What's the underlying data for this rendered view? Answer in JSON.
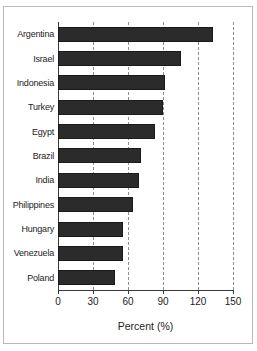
{
  "chart_data": {
    "type": "bar",
    "orientation": "horizontal",
    "title": "",
    "xlabel": "Percent (%)",
    "ylabel": "",
    "xlim": [
      0,
      150
    ],
    "xticks": [
      0,
      30,
      60,
      90,
      120,
      150
    ],
    "xtick_labels": [
      "0",
      "30",
      "60",
      "90",
      "120",
      "150"
    ],
    "grid": "vertical-dashed",
    "legend": "none",
    "bar_color": "#2b2b2b",
    "background_color": "#ffffff",
    "grid_color": "#8d8d8d",
    "axis_color": "#3a3a3a",
    "categories": [
      "Argentina",
      "Israel",
      "Indonesia",
      "Turkey",
      "Egypt",
      "Brazil",
      "India",
      "Philippines",
      "Hungary",
      "Venezuela",
      "Poland"
    ],
    "values": [
      133,
      105,
      92,
      90,
      83,
      71,
      69,
      64,
      56,
      56,
      49
    ]
  }
}
